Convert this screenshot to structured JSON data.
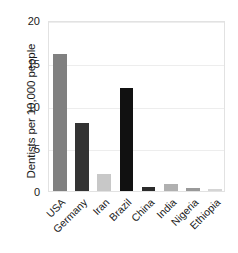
{
  "chart_data": {
    "type": "bar",
    "title": "",
    "xlabel": "",
    "ylabel": "Dentists per 10,000 people",
    "ylim": [
      0,
      20
    ],
    "yticks": [
      0,
      5,
      10,
      15,
      20
    ],
    "ytick_labels": [
      "0",
      "5",
      "10",
      "15",
      "20"
    ],
    "grid": true,
    "legend": "none",
    "categories": [
      "USA",
      "Germany",
      "Iran",
      "Brazil",
      "China",
      "India",
      "Nigeria",
      "Ethiopia"
    ],
    "values": [
      16,
      8,
      2,
      12,
      0.5,
      0.8,
      0.4,
      0.2
    ],
    "bar_colors": [
      "#808080",
      "#333333",
      "#c8c8c8",
      "#111111",
      "#2b2b2b",
      "#b0b0b0",
      "#999999",
      "#d5d5d5"
    ],
    "series": [
      {
        "name": "Dentists per 10,000 people",
        "values": [
          16,
          8,
          2,
          12,
          0.5,
          0.8,
          0.4,
          0.2
        ]
      }
    ]
  },
  "colors": {
    "axis_text": "#1a1a1a",
    "plot_border": "#e2e2e2",
    "gridline": "#ededed",
    "background": "#ffffff"
  }
}
